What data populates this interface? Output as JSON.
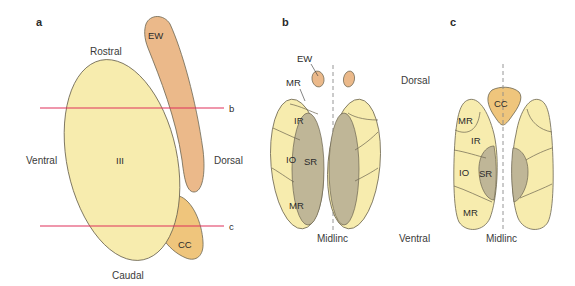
{
  "colors": {
    "nucleus_fill": "#f7ecae",
    "nucleus_stroke": "#6b6450",
    "ew_fill": "#ebb98a",
    "cc_fill": "#efc57c",
    "sr_fill": "#bfb697",
    "section_line": "#e0305a",
    "midline": "#8a8a8a"
  },
  "panel_a": {
    "label": "a",
    "rostral": "Rostral",
    "caudal": "Caudal",
    "ventral": "Ventral",
    "dorsal": "Dorsal",
    "nucleus_label": "III",
    "ew_label": "EW",
    "cc_label": "CC",
    "section_b": "b",
    "section_c": "c"
  },
  "panel_b": {
    "label": "b",
    "ew_label": "EW",
    "mr_top_label": "MR",
    "ir_label": "IR",
    "io_label": "IO",
    "sr_label": "SR",
    "mr_bottom_label": "MR",
    "dorsal": "Dorsal",
    "ventral": "Ventral",
    "midline": "Midlinc"
  },
  "panel_c": {
    "label": "c",
    "cc_label": "CC",
    "mr_top_label": "MR",
    "ir_label": "IR",
    "io_label": "IO",
    "sr_label": "SR",
    "mr_bottom_label": "MR",
    "midline": "Midlinc"
  }
}
